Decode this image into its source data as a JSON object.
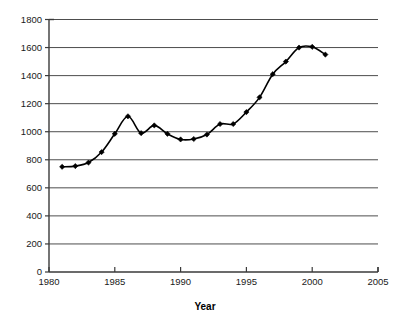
{
  "chart_data": {
    "type": "line",
    "title": "",
    "subtitle": "",
    "xlabel": "Year",
    "ylabel": "",
    "xlim": [
      1980,
      2005
    ],
    "ylim": [
      0,
      1800
    ],
    "grid": "horizontal",
    "legend_position": "none",
    "marker": "filled-diamond",
    "line_color": "#000000",
    "grid_color": "#4d4d4d",
    "axis_color": "#3a3a3a",
    "x_ticks": [
      1980,
      1985,
      1990,
      1995,
      2000,
      2005
    ],
    "x_tick_labels": [
      "1980",
      "1985",
      "1990",
      "1995",
      "2000",
      "2005"
    ],
    "y_ticks": [
      0,
      200,
      400,
      600,
      800,
      1000,
      1200,
      1400,
      1600,
      1800
    ],
    "y_tick_labels": [
      "0",
      "200",
      "400",
      "600",
      "800",
      "1000",
      "1200",
      "1400",
      "1600",
      "1800"
    ],
    "x": [
      1981,
      1982,
      1983,
      1984,
      1985,
      1986,
      1987,
      1988,
      1989,
      1990,
      1991,
      1992,
      1993,
      1994,
      1995,
      1996,
      1997,
      1998,
      1999,
      2000,
      2001
    ],
    "values": [
      750,
      755,
      780,
      855,
      985,
      1110,
      990,
      1045,
      985,
      945,
      948,
      980,
      1055,
      1055,
      1140,
      1245,
      1410,
      1500,
      1600,
      1605,
      1550
    ],
    "series": [
      {
        "name": "series-1",
        "x": [
          1981,
          1982,
          1983,
          1984,
          1985,
          1986,
          1987,
          1988,
          1989,
          1990,
          1991,
          1992,
          1993,
          1994,
          1995,
          1996,
          1997,
          1998,
          1999,
          2000,
          2001
        ],
        "values": [
          750,
          755,
          780,
          855,
          985,
          1110,
          990,
          1045,
          985,
          945,
          948,
          980,
          1055,
          1055,
          1140,
          1245,
          1410,
          1500,
          1600,
          1605,
          1550
        ]
      }
    ]
  }
}
